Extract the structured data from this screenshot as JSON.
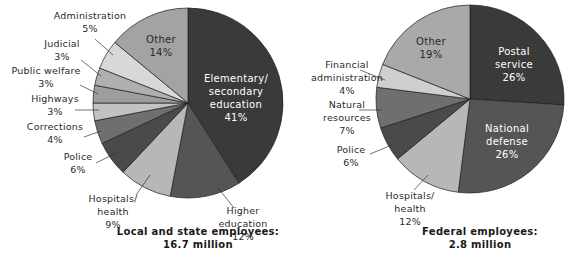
{
  "chart_data": [
    {
      "type": "pie",
      "title": "Local and state employees: 16.7 million",
      "caption_lines": [
        "Local and state employees:",
        "16.7 million"
      ],
      "center": [
        188,
        103
      ],
      "radius": 95,
      "start_angle_deg": 0,
      "slices": [
        {
          "label": "Elementary/ secondary education",
          "lines": [
            "Elementary/",
            "secondary",
            "education",
            "41%"
          ],
          "value": 41,
          "color": "#3a3a3a",
          "text": "light",
          "label_pos": [
            236,
            82
          ],
          "inside": true
        },
        {
          "label": "Higher education",
          "lines": [
            "Higher",
            "education",
            "12%"
          ],
          "value": 12,
          "color": "#555555",
          "text": "dark",
          "label_pos": [
            243,
            214
          ],
          "leader": [
            [
              218,
              188
            ],
            [
              234,
              208
            ]
          ]
        },
        {
          "label": "Hospitals/ health",
          "lines": [
            "Hospitals/",
            "health",
            "9%"
          ],
          "value": 9,
          "color": "#b7b7b7",
          "text": "dark",
          "label_pos": [
            113,
            202
          ],
          "leader": [
            [
              150,
              175
            ],
            [
              136,
              195
            ]
          ]
        },
        {
          "label": "Police",
          "lines": [
            "Police",
            "6%"
          ],
          "value": 6,
          "color": "#4a4a4a",
          "text": "dark",
          "label_pos": [
            78,
            160
          ],
          "leader": [
            [
              118,
              152
            ],
            [
              96,
              163
            ]
          ]
        },
        {
          "label": "Corrections",
          "lines": [
            "Corrections",
            "4%"
          ],
          "value": 4,
          "color": "#6f6f6f",
          "text": "dark",
          "label_pos": [
            55,
            130
          ],
          "leader": [
            [
              101,
              131
            ],
            [
              84,
              137
            ]
          ]
        },
        {
          "label": "Highways",
          "lines": [
            "Highways",
            "3%"
          ],
          "value": 3,
          "color": "#c2c2c2",
          "text": "dark",
          "label_pos": [
            55,
            102
          ],
          "leader": [
            [
              99,
              110
            ],
            [
              75,
              110
            ]
          ]
        },
        {
          "label": "Public welfare",
          "lines": [
            "Public welfare",
            "3%"
          ],
          "value": 3,
          "color": "#9d9d9d",
          "text": "dark",
          "label_pos": [
            46,
            74
          ],
          "leader": [
            [
              98,
              94
            ],
            [
              80,
              85
            ]
          ]
        },
        {
          "label": "Judicial",
          "lines": [
            "Judicial",
            "3%"
          ],
          "value": 3,
          "color": "#b0b0b0",
          "text": "dark",
          "label_pos": [
            62,
            47
          ],
          "leader": [
            [
              101,
              76
            ],
            [
              81,
              60
            ]
          ]
        },
        {
          "label": "Administration",
          "lines": [
            "Administration",
            "5%"
          ],
          "value": 5,
          "color": "#d8d8d8",
          "text": "dark",
          "label_pos": [
            90,
            19
          ],
          "leader": [
            [
              113,
              55
            ],
            [
              95,
              39
            ]
          ]
        },
        {
          "label": "Other",
          "lines": [
            "Other",
            "14%"
          ],
          "value": 14,
          "color": "#a3a3a3",
          "text": "dark",
          "label_pos": [
            161,
            43
          ],
          "inside": true
        }
      ]
    },
    {
      "type": "pie",
      "title": "Federal employees: 2.8 million",
      "caption_lines": [
        "Federal employees:",
        "2.8 million"
      ],
      "center": [
        470,
        99
      ],
      "radius": 94,
      "start_angle_deg": 0,
      "slices": [
        {
          "label": "Postal service",
          "lines": [
            "Postal",
            "service",
            "26%"
          ],
          "value": 26,
          "color": "#3a3a3a",
          "text": "light",
          "label_pos": [
            514,
            55
          ],
          "inside": true
        },
        {
          "label": "National defense",
          "lines": [
            "National",
            "defense",
            "26%"
          ],
          "value": 26,
          "color": "#555555",
          "text": "light",
          "label_pos": [
            507,
            132
          ],
          "inside": true
        },
        {
          "label": "Hospitals/ health",
          "lines": [
            "Hospitals/",
            "health",
            "12%"
          ],
          "value": 12,
          "color": "#b7b7b7",
          "text": "dark",
          "label_pos": [
            410,
            199
          ],
          "leader": [
            [
              428,
              175
            ],
            [
              414,
              190
            ]
          ]
        },
        {
          "label": "Police",
          "lines": [
            "Police",
            "6%"
          ],
          "value": 6,
          "color": "#4a4a4a",
          "text": "dark",
          "label_pos": [
            351,
            153
          ],
          "leader": [
            [
              392,
              145
            ],
            [
              370,
              154
            ]
          ]
        },
        {
          "label": "Natural resources",
          "lines": [
            "Natural",
            "resources",
            "7%"
          ],
          "value": 7,
          "color": "#6f6f6f",
          "text": "dark",
          "label_pos": [
            347,
            108
          ],
          "leader": [
            [
              382,
              110
            ],
            [
              359,
              110
            ]
          ]
        },
        {
          "label": "Financial administration",
          "lines": [
            "Financial",
            "administration",
            "4%"
          ],
          "value": 4,
          "color": "#cfcfcf",
          "text": "dark",
          "label_pos": [
            347,
            68
          ],
          "leader": [
            [
              385,
              80
            ],
            [
              360,
              70
            ]
          ]
        },
        {
          "label": "Other",
          "lines": [
            "Other",
            "19%"
          ],
          "value": 19,
          "color": "#a9a9a9",
          "text": "dark",
          "label_pos": [
            431,
            45
          ],
          "inside": true
        }
      ]
    }
  ]
}
